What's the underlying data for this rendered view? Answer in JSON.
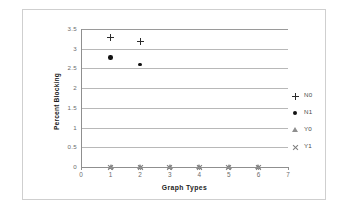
{
  "chart_data": {
    "type": "scatter",
    "title": "",
    "xlabel": "Graph Types",
    "ylabel": "Percent Blocking",
    "xlim": [
      0,
      7
    ],
    "ylim": [
      0,
      3.5
    ],
    "x_ticks": [
      "0",
      "1",
      "2",
      "3",
      "4",
      "5",
      "6",
      "7"
    ],
    "y_ticks": [
      "0",
      "0.5",
      "1",
      "1.5",
      "2",
      "2.5",
      "3",
      "3.5"
    ],
    "grid": true,
    "legend_position": "right",
    "x": [
      1,
      2,
      3,
      4,
      5,
      6
    ],
    "series": [
      {
        "name": "N0",
        "marker": "plus",
        "values": [
          3.28,
          3.19,
          null,
          null,
          null,
          null
        ]
      },
      {
        "name": "N1",
        "marker": "circle",
        "values": [
          2.78,
          2.6,
          null,
          null,
          null,
          null
        ]
      },
      {
        "name": "Y0",
        "marker": "triangle",
        "values": [
          0,
          0,
          0,
          0,
          0,
          0
        ]
      },
      {
        "name": "Y1",
        "marker": "cross",
        "values": [
          0,
          0,
          0,
          0,
          0,
          0
        ]
      }
    ]
  },
  "legend": {
    "items": [
      {
        "label": "N0",
        "marker": "plus-marker-icon"
      },
      {
        "label": "N1",
        "marker": "filled-circle-marker-icon"
      },
      {
        "label": "Y0",
        "marker": "triangle-marker-icon"
      },
      {
        "label": "Y1",
        "marker": "cross-marker-icon"
      }
    ]
  },
  "colors": {
    "gridline": "#b8b8b8",
    "axis": "#8f8f8f",
    "frame": "#cfcfcf",
    "marker_dark": "#121212",
    "marker_gray": "#8f8f8f",
    "background": "#ffffff",
    "tick_text": "#6b6b6b",
    "axis_title": "#1c1c1c"
  }
}
